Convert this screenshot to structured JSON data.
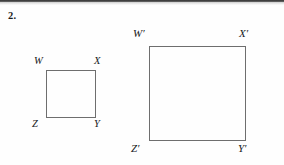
{
  "page": {
    "background_color": "#fefefe",
    "width": 284,
    "height": 165,
    "scan_artifact_color": "#3a3a3a"
  },
  "problem": {
    "number": "2."
  },
  "figure": {
    "type": "similar-figures-dilation",
    "stroke_color": "#6e6e6e",
    "label_color": "#16181a",
    "shapes": [
      {
        "name": "square-small",
        "label": "WXYZ",
        "vertices": [
          "W",
          "X",
          "Y",
          "Z"
        ],
        "x": 46,
        "y": 70,
        "width": 50,
        "height": 48
      },
      {
        "name": "square-large",
        "label": "W'X'Y'Z'",
        "vertices": [
          "W'",
          "X'",
          "Y'",
          "Z'"
        ],
        "x": 149,
        "y": 46,
        "width": 97,
        "height": 95
      }
    ]
  },
  "labels": {
    "small": {
      "top_left": "W",
      "top_right": "X",
      "bottom_left": "Z",
      "bottom_right": "Y"
    },
    "large": {
      "top_left": "W′",
      "top_right": "X′",
      "bottom_left": "Z′",
      "bottom_right": "Y′"
    }
  }
}
